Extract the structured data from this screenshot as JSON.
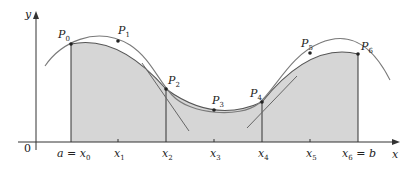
{
  "figure": {
    "axis_labels": {
      "x": "x",
      "y": "y",
      "origin": "0"
    },
    "tick_labels": [
      {
        "main": "a = x",
        "sub": "0"
      },
      {
        "main": "x",
        "sub": "1"
      },
      {
        "main": "x",
        "sub": "2"
      },
      {
        "main": "x",
        "sub": "3"
      },
      {
        "main": "x",
        "sub": "4"
      },
      {
        "main": "x",
        "sub": "5"
      },
      {
        "main": "x",
        "sub": "6",
        "suffix": " = b"
      }
    ],
    "points": [
      {
        "main": "P",
        "sub": "0"
      },
      {
        "main": "P",
        "sub": "1"
      },
      {
        "main": "P",
        "sub": "2"
      },
      {
        "main": "P",
        "sub": "3"
      },
      {
        "main": "P",
        "sub": "4"
      },
      {
        "main": "P",
        "sub": "5"
      },
      {
        "main": "P",
        "sub": "6"
      }
    ],
    "colors": {
      "shade": "#d6d6d6",
      "curve": "#7a7a7a",
      "axis": "#333333",
      "point": "#222222"
    }
  }
}
